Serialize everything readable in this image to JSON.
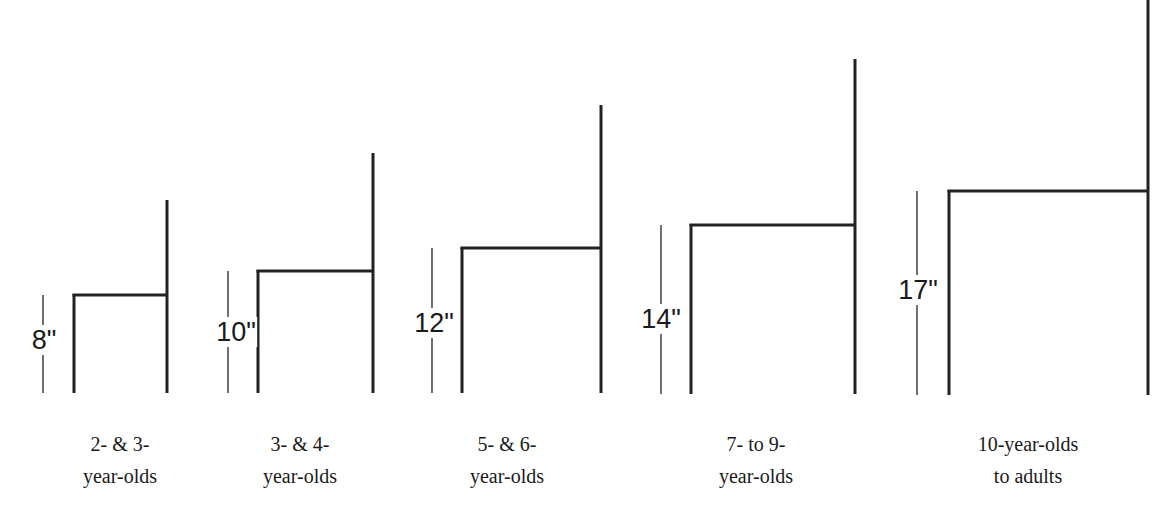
{
  "diagram": {
    "line_color": "#222222",
    "chairs": [
      {
        "seat_height_label": "8\"",
        "seat_height_in": 8,
        "caption_line1": "2- & 3-",
        "caption_line2": "year-olds",
        "geom": {
          "dim_x": 43,
          "front_x": 74,
          "back_x": 167,
          "seat_y": 295,
          "back_top_y": 200,
          "floor_y": 393,
          "label_y": 340,
          "label_x": 44,
          "caption_x": 120
        }
      },
      {
        "seat_height_label": "10\"",
        "seat_height_in": 10,
        "caption_line1": "3- & 4-",
        "caption_line2": "year-olds",
        "geom": {
          "dim_x": 228,
          "front_x": 258,
          "back_x": 373,
          "seat_y": 271,
          "back_top_y": 153,
          "floor_y": 393,
          "label_y": 332,
          "label_x": 236,
          "caption_x": 300
        }
      },
      {
        "seat_height_label": "12\"",
        "seat_height_in": 12,
        "caption_line1": "5- & 6-",
        "caption_line2": "year-olds",
        "geom": {
          "dim_x": 432,
          "front_x": 462,
          "back_x": 601,
          "seat_y": 248,
          "back_top_y": 105,
          "floor_y": 393,
          "label_y": 323,
          "label_x": 434,
          "caption_x": 507
        }
      },
      {
        "seat_height_label": "14\"",
        "seat_height_in": 14,
        "caption_line1": "7- to 9-",
        "caption_line2": "year-olds",
        "geom": {
          "dim_x": 661,
          "front_x": 691,
          "back_x": 855,
          "seat_y": 225,
          "back_top_y": 59,
          "floor_y": 394,
          "label_y": 319,
          "label_x": 661,
          "caption_x": 756
        }
      },
      {
        "seat_height_label": "17\"",
        "seat_height_in": 17,
        "caption_line1": "10-year-olds",
        "caption_line2": "to adults",
        "geom": {
          "dim_x": 917,
          "front_x": 949,
          "back_x": 1148,
          "seat_y": 191,
          "back_top_y": 0,
          "floor_y": 395,
          "label_y": 290,
          "label_x": 918,
          "caption_x": 1028
        }
      }
    ]
  }
}
